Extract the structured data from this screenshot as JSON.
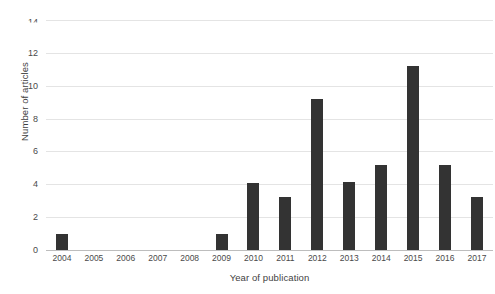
{
  "chart_data": {
    "type": "bar",
    "title": "",
    "xlabel": "Year of publication",
    "ylabel": "Number of articles",
    "categories": [
      "2004",
      "2005",
      "2006",
      "2007",
      "2008",
      "2009",
      "2010",
      "2011",
      "2012",
      "2013",
      "2014",
      "2015",
      "2016",
      "2017"
    ],
    "values": [
      1,
      0,
      0,
      0,
      0,
      1,
      4.1,
      3.2,
      9.2,
      4.15,
      5.15,
      11.2,
      5.2,
      3.2
    ],
    "series": [
      {
        "name": "Number of articles",
        "values": [
          1,
          0,
          0,
          0,
          0,
          1,
          4.1,
          3.2,
          9.2,
          4.15,
          5.15,
          11.2,
          5.2,
          3.2
        ]
      }
    ],
    "ylim": [
      0,
      14
    ],
    "ytick_labels": [
      "0",
      "2",
      "4",
      "6",
      "8",
      "10",
      "12",
      "14"
    ],
    "ytick_values": [
      0,
      2,
      4,
      6,
      8,
      10,
      12,
      14
    ],
    "grid": true,
    "grid_orientation": "horizontal",
    "legend": false,
    "legend_position": "none",
    "bar_color": "#333333",
    "grid_color": "#e4e4e4",
    "axis_color": "#bdbdbd",
    "background_color": "#ffffff"
  }
}
